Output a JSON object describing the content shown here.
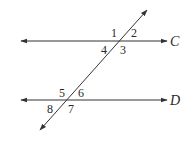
{
  "diagram": {
    "type": "parallel lines cut by a transversal",
    "lines": [
      {
        "name": "C",
        "label": "C",
        "y": 41,
        "x1": 21,
        "x2": 167
      },
      {
        "name": "D",
        "label": "D",
        "y": 100,
        "x1": 21,
        "x2": 167
      }
    ],
    "transversal": {
      "x1": 147,
      "y1": 10,
      "x2": 40,
      "y2": 130
    },
    "angles_at_C": [
      {
        "label": "1",
        "x": 112,
        "y": 36
      },
      {
        "label": "2",
        "x": 131,
        "y": 36
      },
      {
        "label": "3",
        "x": 120,
        "y": 53
      },
      {
        "label": "4",
        "x": 101,
        "y": 53
      }
    ],
    "angles_at_D": [
      {
        "label": "5",
        "x": 59,
        "y": 96
      },
      {
        "label": "6",
        "x": 77,
        "y": 96
      },
      {
        "label": "7",
        "x": 67,
        "y": 112
      },
      {
        "label": "8",
        "x": 47,
        "y": 112
      }
    ],
    "stroke_color": "#333333"
  }
}
